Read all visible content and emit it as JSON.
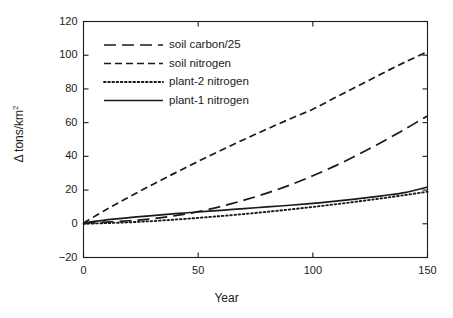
{
  "chart_data": {
    "type": "line",
    "title": "",
    "xlabel": "Year",
    "ylabel": "Δ tons/km²",
    "xlim": [
      0,
      150
    ],
    "ylim": [
      -20,
      120
    ],
    "xticks": [
      0,
      50,
      100,
      150
    ],
    "yticks": [
      -20,
      0,
      20,
      40,
      60,
      80,
      100,
      120
    ],
    "xtick_labels": [
      "0",
      "50",
      "100",
      "150"
    ],
    "ytick_labels": [
      "-20",
      "0",
      "20",
      "40",
      "60",
      "80",
      "100",
      "120"
    ],
    "grid": false,
    "legend_position": "upper left",
    "x": [
      0,
      10,
      20,
      30,
      40,
      50,
      60,
      70,
      80,
      90,
      100,
      110,
      120,
      130,
      140,
      150
    ],
    "series": [
      {
        "name": "soil carbon/25",
        "dash": "long-dash",
        "color": "#1a1a1a",
        "values": [
          0.5,
          1.0,
          1.8,
          3.0,
          4.8,
          7.2,
          10.3,
          14.0,
          18.2,
          23.0,
          28.5,
          34.5,
          41.2,
          48.4,
          56.0,
          64.0
        ]
      },
      {
        "name": "soil nitrogen",
        "dash": "dash",
        "color": "#1a1a1a",
        "values": [
          0.5,
          8.5,
          16.0,
          23.2,
          30.2,
          37.0,
          43.6,
          50.0,
          56.2,
          62.2,
          68.0,
          75.0,
          82.0,
          89.0,
          95.8,
          102.0
        ]
      },
      {
        "name": "plant-2 nitrogen",
        "dash": "dot",
        "color": "#1a1a1a",
        "values": [
          0.0,
          0.4,
          0.9,
          1.6,
          2.5,
          3.5,
          4.6,
          5.8,
          7.1,
          8.5,
          10.0,
          11.6,
          13.3,
          15.1,
          17.0,
          19.0
        ]
      },
      {
        "name": "plant-1 nitrogen",
        "dash": "solid",
        "color": "#1a1a1a",
        "values": [
          0.5,
          2.3,
          3.7,
          4.9,
          6.0,
          7.0,
          8.0,
          9.0,
          10.0,
          11.0,
          12.1,
          13.4,
          14.9,
          16.6,
          18.5,
          21.8
        ]
      }
    ],
    "legend_entries": [
      {
        "label": "soil carbon/25",
        "dash": "long-dash"
      },
      {
        "label": "soil nitrogen",
        "dash": "dash"
      },
      {
        "label": "plant-2 nitrogen",
        "dash": "dot"
      },
      {
        "label": "plant-1 nitrogen",
        "dash": "solid"
      }
    ]
  }
}
